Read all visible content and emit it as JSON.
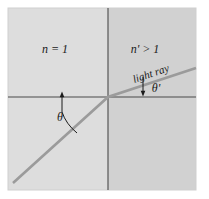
{
  "figure": {
    "name": "refraction-diagram",
    "colors": {
      "page_background": "#ffffff",
      "left_medium_fill": "#dddddd",
      "right_medium_fill": "#d1d1d1",
      "axis_line": "#4a4a4a",
      "ray_line": "#9b9b9b",
      "annotation": "#1a1a1a",
      "panel_border": "#c8c8c8"
    },
    "labels": {
      "left_medium": "n = 1",
      "right_medium": "n' > 1",
      "ray": "light ray",
      "angle_incidence": "θ",
      "angle_refraction": "θ'"
    },
    "geometry": {
      "panel": {
        "x": 8,
        "y": 8,
        "width": 188,
        "height": 182
      },
      "interface_x": 108,
      "horizontal_axis_y": 97,
      "ray_start": {
        "x": 13,
        "y": 183
      },
      "ray_vertex": {
        "x": 108,
        "y": 97
      },
      "ray_end": {
        "x": 196,
        "y": 68
      },
      "normal_arrow_left": {
        "x": 62,
        "y_tip": 93,
        "y_base": 110
      },
      "normal_arrow_right": {
        "x": 143,
        "y_tip": 92,
        "y_base": 75
      },
      "angle_incidence_deg": 42,
      "angle_refraction_deg": 18
    }
  }
}
